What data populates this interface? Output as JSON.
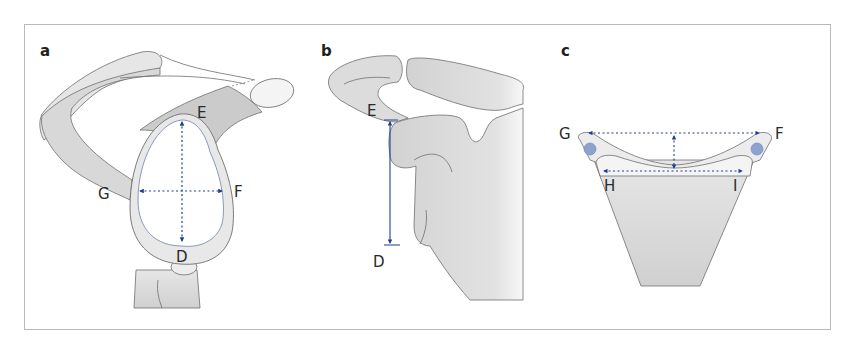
{
  "figure": {
    "colors": {
      "bone_fill": "#e4e4e4",
      "bone_dark_fill": "#cbcbcb",
      "outline": "#6e6e6e",
      "arrow": "#1f3f94",
      "circle_fill": "#8ea2cf",
      "frame": "#b9b9b9"
    },
    "panels": [
      {
        "letter": "a",
        "labels": {
          "E": "E",
          "F": "F",
          "G": "G",
          "D": "D"
        },
        "measurements": [
          "E-D vertical (dashed, double-headed)",
          "G-F horizontal (dashed, double-headed)"
        ]
      },
      {
        "letter": "b",
        "labels": {
          "E": "E",
          "D": "D"
        },
        "measurements": [
          "E-D vertical (solid, double-headed)"
        ]
      },
      {
        "letter": "c",
        "labels": {
          "G": "G",
          "F": "F",
          "H": "H",
          "I": "I"
        },
        "measurements": [
          "G-F horizontal (dashed)",
          "H-I horizontal (dashed)",
          "vertical depth (dashed)"
        ]
      }
    ]
  }
}
